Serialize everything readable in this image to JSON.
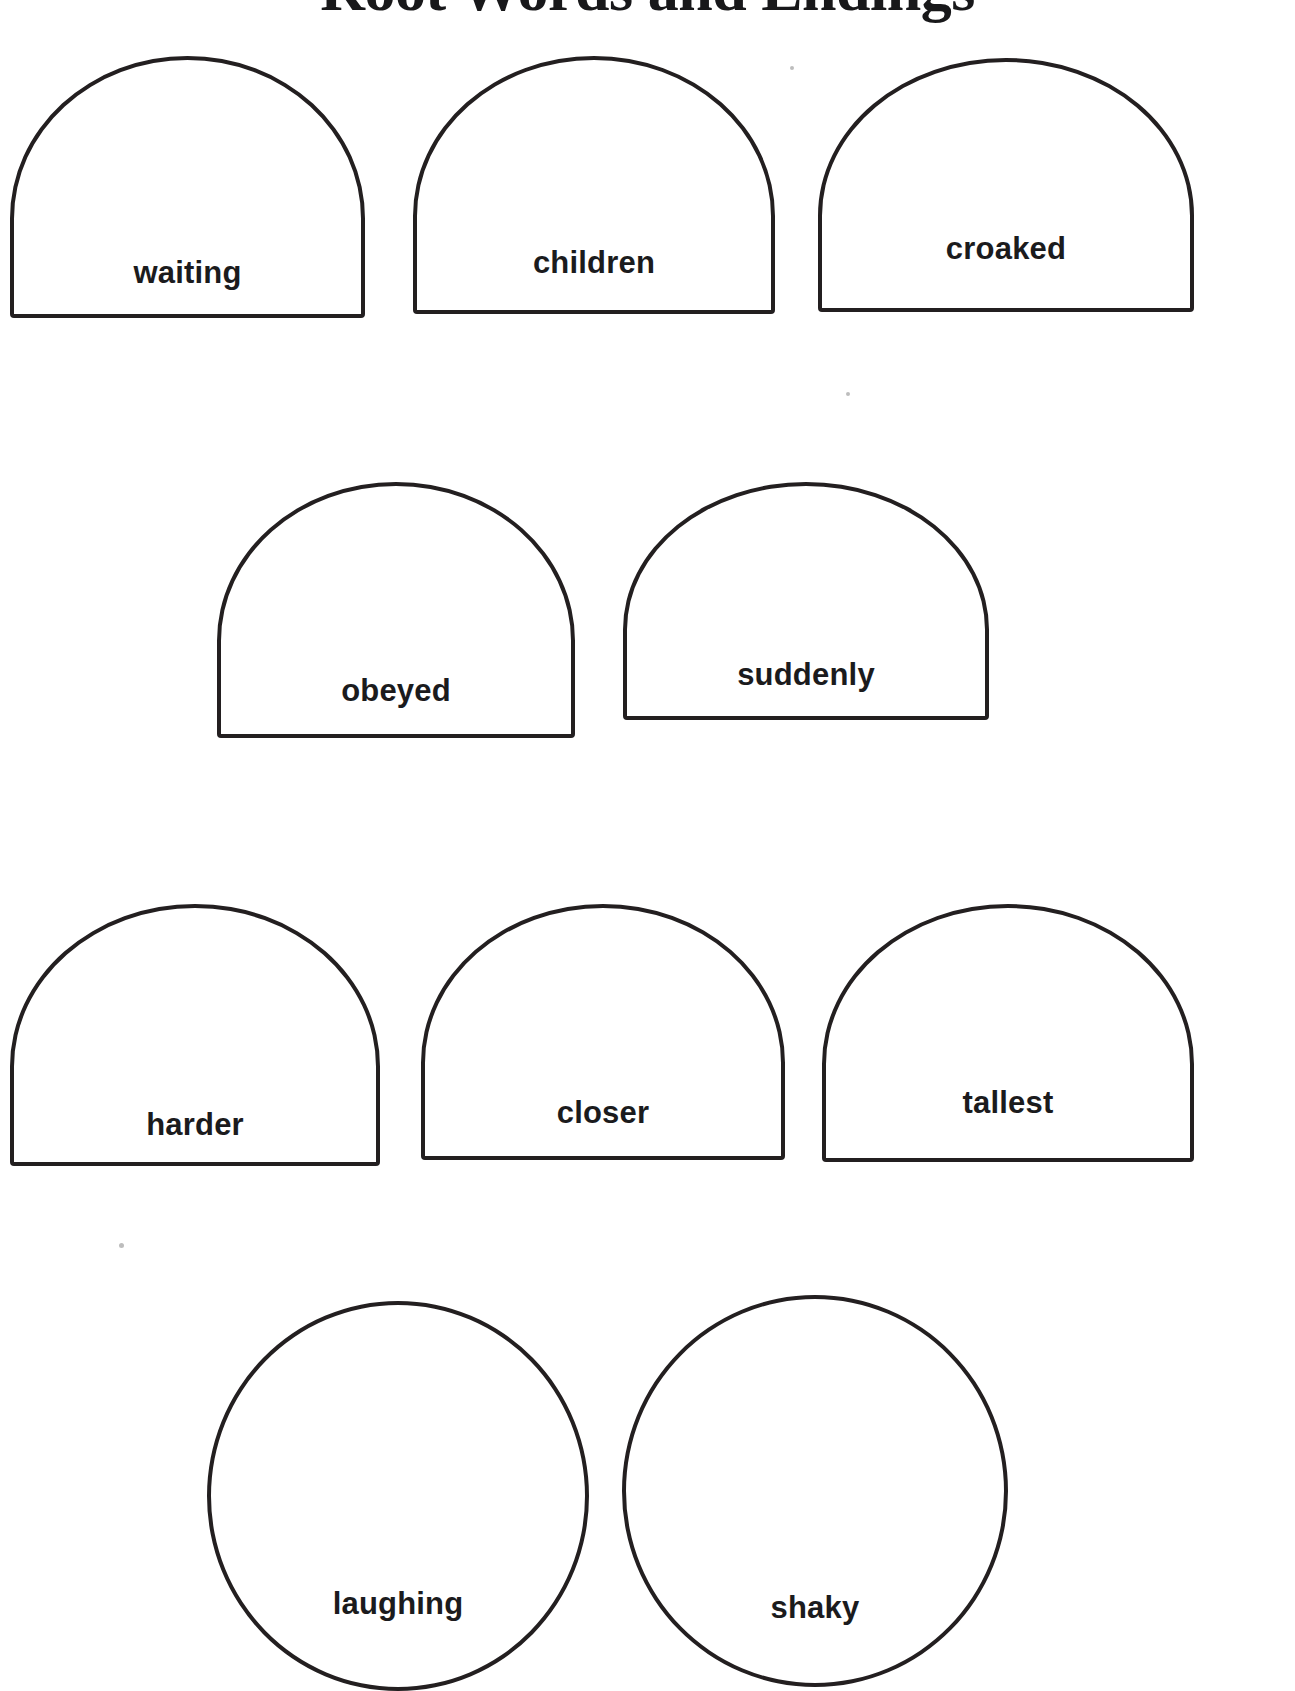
{
  "page": {
    "title": "Root Words and Endings",
    "background_color": "#ffffff",
    "ink_color": "#231f20"
  },
  "rows": [
    {
      "row_index": 1,
      "shapes": [
        {
          "word": "waiting",
          "shape": "dome"
        },
        {
          "word": "children",
          "shape": "dome"
        },
        {
          "word": "croaked",
          "shape": "dome"
        }
      ]
    },
    {
      "row_index": 2,
      "shapes": [
        {
          "word": "obeyed",
          "shape": "dome"
        },
        {
          "word": "suddenly",
          "shape": "dome"
        }
      ]
    },
    {
      "row_index": 3,
      "shapes": [
        {
          "word": "harder",
          "shape": "dome"
        },
        {
          "word": "closer",
          "shape": "dome"
        },
        {
          "word": "tallest",
          "shape": "dome"
        }
      ]
    },
    {
      "row_index": 4,
      "shapes": [
        {
          "word": "laughing",
          "shape": "circle"
        },
        {
          "word": "shaky",
          "shape": "circle"
        }
      ]
    }
  ]
}
